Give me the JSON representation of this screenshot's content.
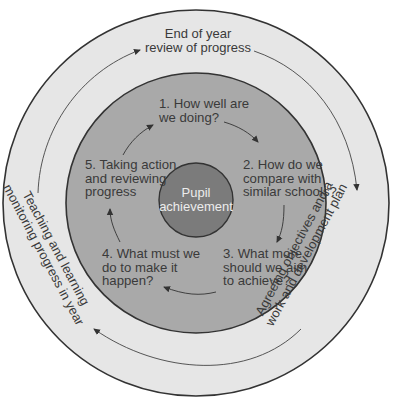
{
  "diagram": {
    "type": "cycle",
    "colors": {
      "outer_ring": "#e6e6e6",
      "middle_disc": "#a9a9a9",
      "inner_disc": "#7b7b7b",
      "stroke": "#333333",
      "text": "#3a3a3a",
      "inner_text": "#ececec"
    },
    "center": {
      "label": "Pupil\nachievement"
    },
    "outer_cycle": [
      {
        "id": "end-of-year-review",
        "label": "End of year\nreview of progress"
      },
      {
        "id": "agreeing-objectives",
        "label": "Agreeing objectives and a\nwork and development plan"
      },
      {
        "id": "teaching-and-learning",
        "label": "Teaching and learning\nmonitoring progress in year"
      }
    ],
    "inner_cycle": [
      {
        "id": "step-1",
        "label": "1. How well are\nwe doing?"
      },
      {
        "id": "step-2",
        "label": "2. How do we\ncompare with\nsimilar schools?"
      },
      {
        "id": "step-3",
        "label": "3. What more\nshould we aim\nto achieve?"
      },
      {
        "id": "step-4",
        "label": "4. What must we\ndo to make it\nhappen?"
      },
      {
        "id": "step-5",
        "label": "5. Taking action\nand reviewing\nprogress"
      }
    ]
  }
}
